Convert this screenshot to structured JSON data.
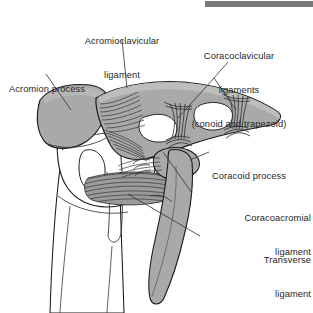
{
  "figure": {
    "topbar_color": "#76787a",
    "bone_fill": "#a9a9a9",
    "bone_fill_light": "#b4b4b4",
    "outline_color": "#1a1a1a",
    "fiber_color": "#4a4a4a",
    "text_color": "#262626",
    "leader_color": "#3a3a3a",
    "background": "#ffffff"
  },
  "labels": [
    {
      "id": "acromioclavicular-ligament",
      "lines": [
        "Acromioclavicular",
        "ligament"
      ],
      "align": "center",
      "x": 62,
      "y": 13,
      "width": 120
    },
    {
      "id": "coracoclavicular-ligaments",
      "lines": [
        "Coracoclavicular",
        "ligaments",
        "(conoid and trapezoid)"
      ],
      "align": "center",
      "x": 168,
      "y": 28,
      "width": 142
    },
    {
      "id": "acromion-process",
      "lines": [
        "Acromion process"
      ],
      "align": "left",
      "x": 9,
      "y": 61,
      "width": 102
    },
    {
      "id": "coracoid-process",
      "lines": [
        "Coracoid process"
      ],
      "align": "left",
      "x": 212,
      "y": 148,
      "width": 100
    },
    {
      "id": "coracoacromial-ligament",
      "lines": [
        "Coracoacromial",
        "ligament"
      ],
      "align": "right",
      "x": 195,
      "y": 190,
      "width": 116
    },
    {
      "id": "transverse-ligament",
      "lines": [
        "Transverse",
        "ligament"
      ],
      "align": "right",
      "x": 203,
      "y": 232,
      "width": 108
    }
  ],
  "structures": [
    {
      "id": "acromion-process",
      "kind": "bone",
      "fill": "#a9a9a9"
    },
    {
      "id": "clavicle",
      "kind": "bone",
      "fill": "#a9a9a9"
    },
    {
      "id": "coracoid-process",
      "kind": "bone",
      "fill": "#a9a9a9"
    },
    {
      "id": "scapula-lateral-border",
      "kind": "bone",
      "fill": "#a9a9a9"
    },
    {
      "id": "humerus-head",
      "kind": "bone",
      "fill": "#ffffff"
    },
    {
      "id": "humerus-shaft",
      "kind": "bone",
      "fill": "#ffffff"
    },
    {
      "id": "greater-tubercle",
      "kind": "bone",
      "fill": "#ffffff"
    },
    {
      "id": "lesser-tubercle",
      "kind": "bone",
      "fill": "#ffffff"
    },
    {
      "id": "bicipital-groove",
      "kind": "landmark",
      "fill": "#ffffff"
    },
    {
      "id": "acromioclavicular-ligament-fibers",
      "kind": "ligament",
      "fill": "#4a4a4a"
    },
    {
      "id": "conoid-ligament-fibers",
      "kind": "ligament",
      "fill": "#3f3f3f"
    },
    {
      "id": "trapezoid-ligament-fibers",
      "kind": "ligament",
      "fill": "#3f3f3f"
    },
    {
      "id": "coracoacromial-ligament-fibers",
      "kind": "ligament",
      "fill": "#4a4a4a"
    },
    {
      "id": "transverse-humeral-ligament-fibers",
      "kind": "ligament",
      "fill": "#4a4a4a"
    }
  ],
  "topbar": {
    "x": 205,
    "y": 1,
    "width": 108,
    "height": 6
  }
}
